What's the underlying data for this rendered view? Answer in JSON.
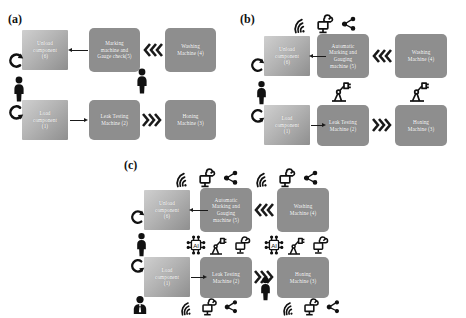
{
  "figure": {
    "type": "process-flow-diagram",
    "panels": [
      {
        "id": "a",
        "label": "(a)",
        "caption_position": "top-left",
        "nodes": [
          {
            "id": "unload",
            "label": "Unload component (6)",
            "lines": [
              "Unload",
              "component",
              "(6)"
            ],
            "style": "manual"
          },
          {
            "id": "marking",
            "label": "Marking machine and Gauge check(5)",
            "lines": [
              "Marking",
              "machine and",
              "Gauge check(5)"
            ],
            "style": "machine"
          },
          {
            "id": "washing",
            "label": "Washing Machine (4)",
            "lines": [
              "Washing",
              "Machine (4)"
            ],
            "style": "machine"
          },
          {
            "id": "load",
            "label": "Load component (1)",
            "lines": [
              "Load",
              "component",
              "(1)"
            ],
            "style": "manual"
          },
          {
            "id": "leak",
            "label": "Leak Testing Machine (2)",
            "lines": [
              "Leak Testing",
              "Machine (2)"
            ],
            "style": "machine"
          },
          {
            "id": "honing",
            "label": "Honing Machine (3)",
            "lines": [
              "Honing",
              "Machine (3)"
            ],
            "style": "machine"
          }
        ],
        "icons": [
          "worker-person-icon",
          "worker-person-icon",
          "curved-arrow-icon",
          "curved-arrow-icon"
        ]
      },
      {
        "id": "b",
        "label": "(b)",
        "caption_position": "top-left",
        "nodes": [
          {
            "id": "unload",
            "label": "Unload component (6)",
            "lines": [
              "Unload",
              "component",
              "(6)"
            ],
            "style": "manual"
          },
          {
            "id": "marking",
            "label": "Automatic Marking and Gauging machine (5)",
            "lines": [
              "Automatic",
              "Marking and",
              "Gauging",
              "machine (5)"
            ],
            "style": "machine"
          },
          {
            "id": "washing",
            "label": "Washing Machine (4)",
            "lines": [
              "Washing",
              "Machine (4)"
            ],
            "style": "machine"
          },
          {
            "id": "load",
            "label": "Load component (1)",
            "lines": [
              "Load",
              "component",
              "(1)"
            ],
            "style": "manual"
          },
          {
            "id": "leak",
            "label": "Leak Testing Machine (2)",
            "lines": [
              "Leak Testing",
              "Machine (2)"
            ],
            "style": "machine"
          },
          {
            "id": "honing",
            "label": "Honing Machine (3)",
            "lines": [
              "Honing",
              "Machine (3)"
            ],
            "style": "machine"
          }
        ],
        "icons": [
          "wifi-icon",
          "cloud-monitor-icon",
          "network-share-icon",
          "robot-arm-icon",
          "robot-arm-icon",
          "worker-person-icon",
          "curved-arrow-icon"
        ]
      },
      {
        "id": "c",
        "label": "(c)",
        "caption_position": "top-left",
        "nodes": [
          {
            "id": "unload",
            "label": "Unload component (6)",
            "lines": [
              "Unload",
              "component",
              "(6)"
            ],
            "style": "manual"
          },
          {
            "id": "marking",
            "label": "Automatic Marking and Gauging machine (5)",
            "lines": [
              "Automatic",
              "Marking and",
              "Gauging",
              "machine (5)"
            ],
            "style": "machine"
          },
          {
            "id": "washing",
            "label": "Washing Machine (4)",
            "lines": [
              "Washing",
              "Machine (4)"
            ],
            "style": "machine"
          },
          {
            "id": "load",
            "label": "Load component (1)",
            "lines": [
              "Load",
              "component",
              "(1)"
            ],
            "style": "manual"
          },
          {
            "id": "leak",
            "label": "Leak Testing Machine (2)",
            "lines": [
              "Leak Testing",
              "Machine (2)"
            ],
            "style": "machine"
          },
          {
            "id": "honing",
            "label": "Honing Machine (3)",
            "lines": [
              "Honing",
              "Machine (3)"
            ],
            "style": "machine"
          }
        ],
        "icons": [
          "wifi-icon",
          "cloud-monitor-icon",
          "network-share-icon",
          "ai-chip-icon",
          "robot-arm-icon",
          "business-person-icon",
          "worker-person-icon",
          "curved-arrow-icon"
        ]
      }
    ],
    "colors": {
      "machine_fill": "#8e8e8e",
      "manual_fill_light": "#cfcfcf",
      "manual_fill_dark": "#8f8f8f",
      "node_text": "#ffffff",
      "arrow": "#1a1a1a",
      "background": "#ffffff",
      "label_text": "#111111"
    }
  }
}
